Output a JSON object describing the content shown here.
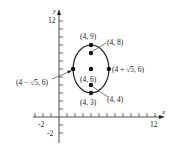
{
  "diagram": {
    "axes": {
      "x_label": "x",
      "y_label": "y",
      "x_tick_labels": [
        "-2",
        "12"
      ],
      "y_tick_labels": [
        "12",
        "-2"
      ],
      "x_range": [
        -3,
        13
      ],
      "y_range": [
        -3,
        13
      ],
      "tick_spacing": 1
    },
    "ellipse": {
      "center": [
        4,
        6
      ],
      "semi_major_vertical": 3,
      "semi_minor_horizontal": 2.236
    },
    "points": [
      {
        "id": "vertex-top",
        "label": "(4, 9)",
        "x": 4,
        "y": 9
      },
      {
        "id": "focus-top",
        "label": "(4, 8)",
        "x": 4,
        "y": 8
      },
      {
        "id": "center",
        "label": "(4, 6)",
        "x": 4,
        "y": 6
      },
      {
        "id": "focus-bottom",
        "label": "(4, 4)",
        "x": 4,
        "y": 4
      },
      {
        "id": "vertex-bottom",
        "label": "(4, 3)",
        "x": 4,
        "y": 3
      },
      {
        "id": "covertex-left",
        "label": "(4 − √5, 6)",
        "x": 1.764,
        "y": 6
      },
      {
        "id": "covertex-right",
        "label": "(4 + √5, 6)",
        "x": 6.236,
        "y": 6
      }
    ],
    "colors": {
      "stroke": "#222222",
      "background": "#ffffff"
    }
  }
}
